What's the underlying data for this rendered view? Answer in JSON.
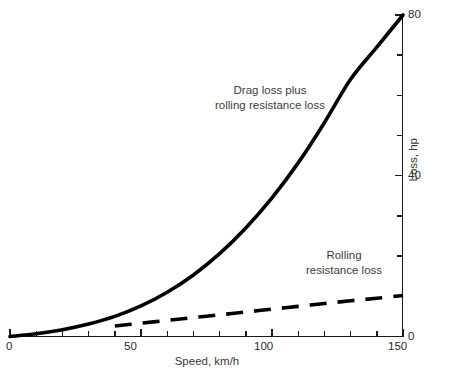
{
  "chart_data": {
    "type": "line",
    "title": "",
    "xlabel": "Speed, km/h",
    "ylabel": "Loss, hp",
    "xlim": [
      0,
      150
    ],
    "ylim": [
      0,
      80
    ],
    "grid": false,
    "legend_position": "inline-annotations",
    "y_axis_side": "right",
    "x_ticks_major": [
      0,
      50,
      100,
      150
    ],
    "x_tick_labels": [
      "0",
      "50",
      "100",
      "150"
    ],
    "x_tick_minor_step": 10,
    "y_ticks_major": [
      0,
      40,
      80
    ],
    "y_tick_labels": [
      "0",
      "40",
      "80"
    ],
    "y_tick_minor_step": 10,
    "series": [
      {
        "name": "Drag loss plus rolling resistance loss",
        "style": "solid",
        "color": "#000000",
        "x": [
          0,
          10,
          20,
          30,
          40,
          50,
          60,
          70,
          80,
          90,
          100,
          110,
          120,
          130,
          140,
          150
        ],
        "values": [
          0,
          0.7,
          1.7,
          3.1,
          5.0,
          7.6,
          11.0,
          15.3,
          20.6,
          27.0,
          34.5,
          43.2,
          53.2,
          64.0,
          72.0,
          80.0
        ]
      },
      {
        "name": "Rolling resistance loss",
        "style": "dashed",
        "color": "#000000",
        "x": [
          0,
          10,
          20,
          30,
          40,
          50,
          60,
          70,
          80,
          90,
          100,
          110,
          120,
          130,
          140,
          150
        ],
        "values": [
          0,
          0.6,
          1.3,
          1.9,
          2.6,
          3.3,
          4.0,
          4.7,
          5.4,
          6.1,
          6.8,
          7.5,
          8.2,
          8.9,
          9.5,
          10.2
        ],
        "visible_from_x": 40
      }
    ],
    "annotations": [
      {
        "name": "drag-plus-rolling",
        "lines": [
          "Drag loss plus",
          "rolling resistance loss"
        ]
      },
      {
        "name": "rolling-resistance",
        "lines": [
          "Rolling",
          "resistance loss"
        ]
      }
    ],
    "colors": {
      "curve": "#000000",
      "axis": "#1a1a1a",
      "text": "#3a3a3a",
      "background": "#ffffff"
    }
  },
  "axes": {
    "x_title": "Speed, km/h",
    "y_title": "Loss, hp",
    "x_labels": [
      "0",
      "50",
      "100",
      "150"
    ],
    "y_labels": [
      "0",
      "40",
      "80"
    ]
  },
  "annotations": {
    "drag": {
      "line1": "Drag loss plus",
      "line2": "rolling resistance loss"
    },
    "rolling": {
      "line1": "Rolling",
      "line2": "resistance loss"
    }
  }
}
